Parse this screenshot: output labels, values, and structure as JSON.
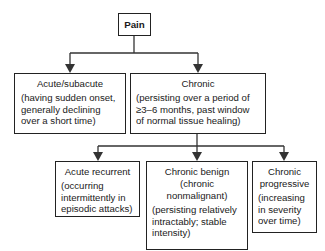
{
  "diagram": {
    "root": {
      "label": "Pain"
    },
    "level1": [
      {
        "title": "Acute/subacute",
        "description": "(having sudden onset,\ngenerally declining\nover a short time)"
      },
      {
        "title": "Chronic",
        "description": "(persisting over a period of\n≥3–6 months, past window\nof normal tissue healing)"
      }
    ],
    "level2": [
      {
        "title": "Acute recurrent",
        "description": "(occurring\nintermittently in\nepisodic attacks)"
      },
      {
        "title": "Chronic benign\n(chronic\nnonmalignant)",
        "description": "(persisting relatively\nintractably; stable\nintensity)"
      },
      {
        "title": "Chronic\nprogressive",
        "description": "(increasing\nin severity\nover time)"
      }
    ],
    "edges": [
      {
        "from": "Pain",
        "to": "Acute/subacute"
      },
      {
        "from": "Pain",
        "to": "Chronic"
      },
      {
        "from": "Chronic",
        "to": "Acute recurrent"
      },
      {
        "from": "Chronic",
        "to": "Chronic benign"
      },
      {
        "from": "Chronic",
        "to": "Chronic progressive"
      }
    ],
    "colors": {
      "line": "#222222",
      "background": "#ffffff",
      "text": "#1a1a1a"
    }
  }
}
